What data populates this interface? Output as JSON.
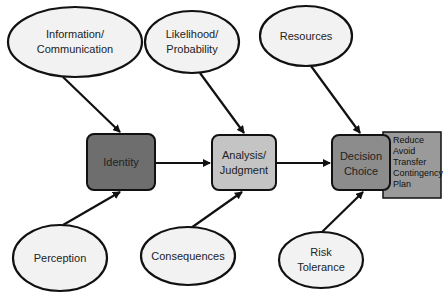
{
  "diagram": {
    "colors": {
      "ellipse_fill": "#f2f2f2",
      "stroke": "#111111",
      "identity_fill": "#6e6e6e",
      "analysis_fill": "#c4c4c4",
      "decision_fill": "#8c8c8c",
      "options_fill": "#9a9a9a"
    },
    "inputs_top": [
      {
        "id": "info",
        "line1": "Information/",
        "line2": "Communication",
        "target": "identity"
      },
      {
        "id": "likelihood",
        "line1": "Likelihood/",
        "line2": "Probability",
        "target": "analysis"
      },
      {
        "id": "resources",
        "line1": "Resources",
        "line2": "",
        "target": "decision"
      }
    ],
    "inputs_bottom": [
      {
        "id": "perception",
        "line1": "Perception",
        "line2": "",
        "target": "identity"
      },
      {
        "id": "consequences",
        "line1": "Consequences",
        "line2": "",
        "target": "analysis"
      },
      {
        "id": "risk",
        "line1": "Risk",
        "line2": "Tolerance",
        "target": "decision"
      }
    ],
    "process": [
      {
        "id": "identity",
        "line1": "Identity",
        "line2": ""
      },
      {
        "id": "analysis",
        "line1": "Analysis/",
        "line2": "Judgment"
      },
      {
        "id": "decision",
        "line1": "Decision",
        "line2": "Choice"
      }
    ],
    "options": [
      "Reduce",
      "Avoid",
      "Transfer",
      "Contingency",
      "Plan"
    ]
  }
}
